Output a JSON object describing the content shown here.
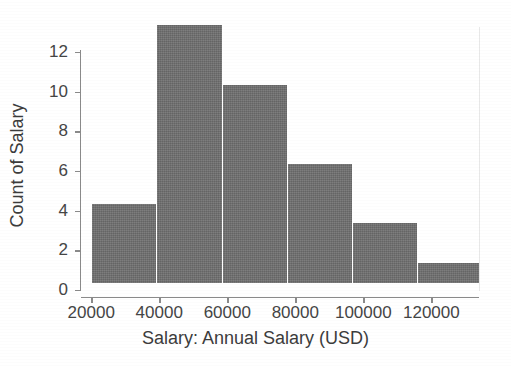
{
  "chart_data": {
    "type": "bar",
    "title": "",
    "xlabel": "Salary: Annual Salary (USD)",
    "ylabel": "Count of Salary",
    "grid": false,
    "legend": null,
    "xlim": [
      17000,
      134000
    ],
    "ylim": [
      0,
      12.8
    ],
    "xticks": [
      20000,
      40000,
      60000,
      80000,
      100000,
      120000
    ],
    "xtick_labels": [
      "20000",
      "40000",
      "60000",
      "80000",
      "100000",
      "120000"
    ],
    "yticks": [
      0,
      2,
      4,
      6,
      8,
      10,
      12
    ],
    "ytick_labels": [
      "0",
      "2",
      "4",
      "6",
      "8",
      "10",
      "12"
    ],
    "bar_color": "#6f6f6f",
    "bin_edges": [
      24000,
      41000,
      58000,
      75000,
      92000,
      109000,
      126000
    ],
    "categories": [
      "24000-41000",
      "41000-58000",
      "58000-75000",
      "75000-92000",
      "92000-109000",
      "109000-126000"
    ],
    "values": [
      4,
      13,
      10,
      6,
      3,
      1
    ],
    "bars": [
      {
        "label": "24000-41000",
        "value": 4,
        "left_px": 92,
        "width_px": 65
      },
      {
        "label": "41000-58000",
        "value": 13,
        "left_px": 157,
        "width_px": 66
      },
      {
        "label": "58000-75000",
        "value": 10,
        "left_px": 223,
        "width_px": 65
      },
      {
        "label": "75000-92000",
        "value": 6,
        "left_px": 288,
        "width_px": 65
      },
      {
        "label": "92000-109000",
        "value": 3,
        "left_px": 353,
        "width_px": 65
      },
      {
        "label": "109000-126000",
        "value": 1,
        "left_px": 418,
        "width_px": 61
      }
    ]
  }
}
